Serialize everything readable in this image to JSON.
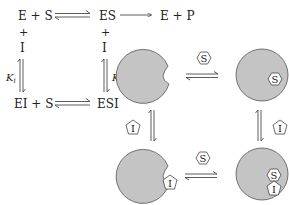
{
  "scheme": {
    "top_left": "E + S",
    "top_mid": "ES",
    "top_right": "E + P",
    "plus_left": "+",
    "plus_mid": "+",
    "inhibitor_left": "I",
    "inhibitor_mid": "I",
    "ki_left": "K",
    "ki_left_sub": "i",
    "ki_mid": "K",
    "ki_mid_sub": "i",
    "bottom_left": "EI + S",
    "bottom_mid": "ESI"
  },
  "cartoon": {
    "substrate_label": "S",
    "inhibitor_label": "I",
    "enzyme_fill": "#c4c4c4",
    "outline_color": "#555555"
  }
}
